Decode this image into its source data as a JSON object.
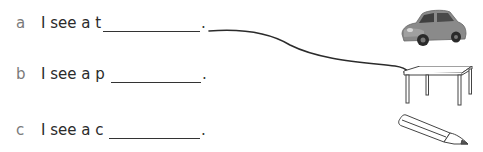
{
  "exercise": {
    "items": [
      {
        "letter": "a",
        "sentence": "I see a t",
        "blank": "",
        "end": ".",
        "picture": "car",
        "picture_icon": "car-icon"
      },
      {
        "letter": "b",
        "sentence": "I see a p",
        "blank": "",
        "end": ".",
        "picture": "table",
        "picture_icon": "table-icon"
      },
      {
        "letter": "c",
        "sentence": "I see a c",
        "blank": "",
        "end": ".",
        "picture": "pencil",
        "picture_icon": "pencil-icon"
      }
    ],
    "connector": {
      "from": "a",
      "to": "table",
      "color": "#2b2b2b"
    }
  }
}
